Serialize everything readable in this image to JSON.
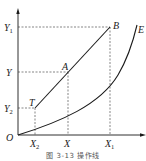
{
  "figure": {
    "axis_labels": {
      "origin": "O",
      "y_ticks": [
        {
          "main": "Y",
          "sub": "1"
        },
        {
          "main": "Y",
          "sub": ""
        },
        {
          "main": "Y",
          "sub": "2"
        }
      ],
      "x_ticks": [
        {
          "main": "X",
          "sub": "2"
        },
        {
          "main": "X",
          "sub": ""
        },
        {
          "main": "X",
          "sub": "1"
        }
      ]
    },
    "points": {
      "T": "T",
      "A": "A",
      "B": "B",
      "E": "E"
    },
    "caption": "图 3-13 操作线",
    "line_color": "#1a1a1a",
    "dash_color": "#333333"
  }
}
